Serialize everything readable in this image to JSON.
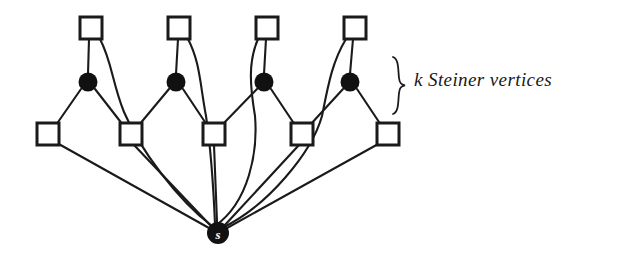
{
  "figure": {
    "background_color": "#ffffff",
    "stroke_color": "#1a1a1a",
    "fill_color": "#111111",
    "width": 627,
    "height": 256
  },
  "annotation": {
    "brace_label": "k Steiner vertices",
    "brace_name": "curly-brace",
    "brace_span": {
      "x": 396,
      "y_top": 57,
      "y_bottom": 113
    }
  },
  "nodes": {
    "root": {
      "id": "s",
      "label": "s",
      "shape": "circle",
      "filled": true,
      "cx": 218,
      "cy": 233,
      "r": 11,
      "label_color": "#ffffff"
    },
    "steiner_vertices": [
      {
        "id": "t1",
        "label": "",
        "shape": "circle",
        "filled": true,
        "cx": 88,
        "cy": 82,
        "r": 9
      },
      {
        "id": "t2",
        "label": "",
        "shape": "circle",
        "filled": true,
        "cx": 176,
        "cy": 82,
        "r": 9
      },
      {
        "id": "t3",
        "label": "",
        "shape": "circle",
        "filled": true,
        "cx": 264,
        "cy": 82,
        "r": 9
      },
      {
        "id": "t4",
        "label": "",
        "shape": "circle",
        "filled": true,
        "cx": 350,
        "cy": 82,
        "r": 9
      }
    ],
    "top_terminals": [
      {
        "id": "u1",
        "label": "",
        "shape": "square",
        "filled": false,
        "cx": 91,
        "cy": 28,
        "size": 22
      },
      {
        "id": "u2",
        "label": "",
        "shape": "square",
        "filled": false,
        "cx": 179,
        "cy": 28,
        "size": 22
      },
      {
        "id": "u3",
        "label": "",
        "shape": "square",
        "filled": false,
        "cx": 267,
        "cy": 28,
        "size": 22
      },
      {
        "id": "u4",
        "label": "",
        "shape": "square",
        "filled": false,
        "cx": 355,
        "cy": 28,
        "size": 22
      }
    ],
    "bottom_terminals": [
      {
        "id": "v1",
        "label": "",
        "shape": "square",
        "filled": false,
        "cx": 48,
        "cy": 134,
        "size": 22
      },
      {
        "id": "v2",
        "label": "",
        "shape": "square",
        "filled": false,
        "cx": 131,
        "cy": 134,
        "size": 22
      },
      {
        "id": "v3",
        "label": "",
        "shape": "square",
        "filled": false,
        "cx": 214,
        "cy": 134,
        "size": 22
      },
      {
        "id": "v4",
        "label": "",
        "shape": "square",
        "filled": false,
        "cx": 302,
        "cy": 134,
        "size": 22
      },
      {
        "id": "v5",
        "label": "",
        "shape": "square",
        "filled": false,
        "cx": 388,
        "cy": 134,
        "size": 22
      }
    ]
  },
  "edges": {
    "straight_top_to_steiner": [
      {
        "from": "u1",
        "to": "t1"
      },
      {
        "from": "u2",
        "to": "t2"
      },
      {
        "from": "u3",
        "to": "t3"
      },
      {
        "from": "u4",
        "to": "t4"
      }
    ],
    "straight_steiner_to_bottom": [
      {
        "from": "t1",
        "to": "v1"
      },
      {
        "from": "t1",
        "to": "v2"
      },
      {
        "from": "t2",
        "to": "v2"
      },
      {
        "from": "t2",
        "to": "v3"
      },
      {
        "from": "t3",
        "to": "v3"
      },
      {
        "from": "t3",
        "to": "v4"
      },
      {
        "from": "t4",
        "to": "v4"
      },
      {
        "from": "t4",
        "to": "v5"
      }
    ],
    "curved_top_to_root": [
      {
        "from": "u1",
        "to": "s"
      },
      {
        "from": "u2",
        "to": "s"
      },
      {
        "from": "u3",
        "to": "s"
      },
      {
        "from": "u4",
        "to": "s"
      }
    ],
    "straight_bottom_to_root": [
      {
        "from": "v1",
        "to": "s"
      },
      {
        "from": "v2",
        "to": "s"
      },
      {
        "from": "v3",
        "to": "s"
      },
      {
        "from": "v4",
        "to": "s"
      },
      {
        "from": "v5",
        "to": "s"
      }
    ]
  },
  "counts": {
    "steiner_vertices": 4,
    "top_terminals": 4,
    "bottom_terminals": 5,
    "root_nodes": 1
  }
}
